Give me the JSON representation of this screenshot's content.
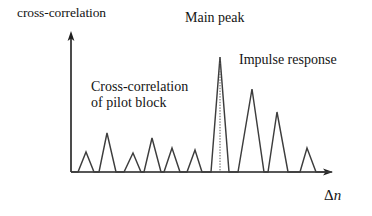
{
  "figure": {
    "title_none": "",
    "background_color": "#ffffff",
    "stroke_color": "#3a3a3a",
    "axis_color": "#1f1f1f"
  },
  "labels": {
    "y_axis": "cross-correlation",
    "x_axis_delta": "Δ",
    "x_axis_n": "n",
    "main_peak": "Main peak",
    "impulse_response": "Impulse response",
    "cross_correlation_line1": "Cross-correlation",
    "cross_correlation_line2": "of pilot block"
  },
  "chart_data": {
    "type": "line",
    "title": "",
    "xlabel": "Δn",
    "ylabel": "cross-correlation",
    "grid": false,
    "legend": "none",
    "axes": {
      "origin_px": [
        71,
        172
      ],
      "x_axis_end_px": [
        332,
        172
      ],
      "y_axis_top_px": [
        71,
        33
      ],
      "x_arrow": true,
      "y_arrow": true,
      "ticks": [],
      "tick_labels": []
    },
    "annotations": [
      {
        "text": "Main peak",
        "target": "main peak apex",
        "position_px": [
          222,
          22
        ]
      },
      {
        "text": "Impulse response",
        "target": "decaying multipath taps right of main peak",
        "position_px": [
          295,
          64
        ]
      },
      {
        "text": "Cross-correlation of pilot block",
        "target": "small side lobes left of main peak",
        "position_px": [
          148,
          95
        ]
      }
    ],
    "marker_line": {
      "style": "dotted",
      "orientation": "vertical",
      "x_px": 220,
      "y_from_px": 57,
      "y_to_px": 172
    },
    "series": [
      {
        "name": "cross-correlation magnitude",
        "comment": "piecewise-linear vertex list in pixel coordinates; baseline y = 172",
        "points_px": [
          [
            71,
            172
          ],
          [
            78,
            172
          ],
          [
            86,
            152
          ],
          [
            94,
            172
          ],
          [
            99,
            172
          ],
          [
            107,
            133
          ],
          [
            116,
            172
          ],
          [
            124,
            172
          ],
          [
            133,
            153
          ],
          [
            141,
            172
          ],
          [
            144,
            172
          ],
          [
            152,
            138
          ],
          [
            161,
            172
          ],
          [
            164,
            172
          ],
          [
            172,
            148
          ],
          [
            180,
            172
          ],
          [
            187,
            172
          ],
          [
            195,
            150
          ],
          [
            202,
            172
          ],
          [
            211,
            172
          ],
          [
            220,
            57
          ],
          [
            229,
            172
          ],
          [
            238,
            172
          ],
          [
            252,
            89
          ],
          [
            264,
            172
          ],
          [
            268,
            172
          ],
          [
            277,
            112
          ],
          [
            288,
            172
          ],
          [
            300,
            172
          ],
          [
            307,
            148
          ],
          [
            316,
            172
          ],
          [
            332,
            172
          ]
        ],
        "peaks_px": [
          [
            86,
            152
          ],
          [
            107,
            133
          ],
          [
            133,
            153
          ],
          [
            152,
            138
          ],
          [
            172,
            148
          ],
          [
            195,
            150
          ],
          [
            220,
            57
          ],
          [
            252,
            89
          ],
          [
            277,
            112
          ],
          [
            307,
            148
          ]
        ],
        "relative_peak_heights": [
          0.17,
          0.34,
          0.17,
          0.3,
          0.21,
          0.19,
          1.0,
          0.72,
          0.52,
          0.21
        ]
      }
    ]
  }
}
